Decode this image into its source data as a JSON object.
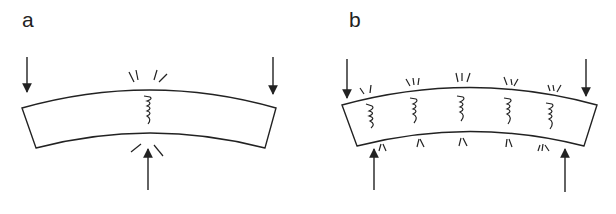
{
  "panels": [
    {
      "label": "a",
      "description": "Three-point bending of a beam: two downward loads at the ends, one upward support at center; single crack forms at center top (tension side)",
      "downward_arrows": 2,
      "upward_arrows": 1,
      "cracks": 1
    },
    {
      "label": "b",
      "description": "Four-point bending of a beam: two downward loads at the ends, two upward supports inboard; multiple cracks distributed along the top",
      "downward_arrows": 2,
      "upward_arrows": 2,
      "cracks": 5
    }
  ],
  "colors": {
    "stroke": "#222222",
    "background": "#ffffff"
  }
}
